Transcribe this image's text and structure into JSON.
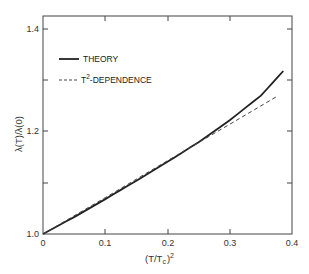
{
  "chart_data": {
    "type": "line",
    "title": "",
    "xlabel": "(T/Tc)²",
    "ylabel": "λ(T)/λ(0)",
    "xlim": [
      0,
      0.4
    ],
    "ylim": [
      1.0,
      1.43
    ],
    "grid": false,
    "legend_position": "upper-left",
    "x_ticks": [
      "0",
      "0.1",
      "0.2",
      "0.3",
      "0.4"
    ],
    "y_ticks": [
      "1.0",
      "1.2",
      "1.4"
    ],
    "y_minor_ticks": [
      1.1,
      1.3
    ],
    "series": [
      {
        "name": "THEORY",
        "style": "solid",
        "x": [
          0.0,
          0.05,
          0.1,
          0.15,
          0.2,
          0.25,
          0.3,
          0.35,
          0.386
        ],
        "y": [
          1.0,
          1.033,
          1.068,
          1.104,
          1.141,
          1.179,
          1.222,
          1.27,
          1.318
        ]
      },
      {
        "name": "T²-DEPENDENCE",
        "style": "dashed",
        "x": [
          0.0,
          0.1,
          0.2,
          0.3,
          0.378
        ],
        "y": [
          1.0,
          1.071,
          1.143,
          1.214,
          1.27
        ]
      }
    ]
  },
  "labels": {
    "x_axis_title_main": "(T/T",
    "x_axis_title_sub": "c",
    "x_axis_title_end": ")",
    "x_axis_title_sup": "2",
    "y_axis_title": "λ(T)/λ(0)",
    "x_tick_0": "0",
    "x_tick_1": "0.1",
    "x_tick_2": "0.2",
    "x_tick_3": "0.3",
    "x_tick_4": "0.4",
    "y_tick_0": "1.0",
    "y_tick_1": "1.2",
    "y_tick_2": "1.4"
  },
  "legend": {
    "theory_label": "THEORY",
    "t2_prefix": "T",
    "t2_sup": "2",
    "t2_suffix": "-DEPENDENCE"
  }
}
